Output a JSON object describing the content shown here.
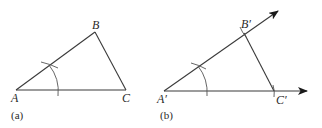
{
  "figure_a": {
    "caption": "(a)",
    "vertices": {
      "A": {
        "label": "A",
        "x": 16,
        "y": 90
      },
      "B": {
        "label": "B",
        "x": 95,
        "y": 32
      },
      "C": {
        "label": "C",
        "x": 126,
        "y": 90
      }
    }
  },
  "figure_b": {
    "caption": "(b)",
    "vertices": {
      "A": {
        "label": "A′",
        "x": 164,
        "y": 91
      },
      "B": {
        "label": "B′",
        "x": 244,
        "y": 33
      },
      "C": {
        "label": "C′",
        "x": 274,
        "y": 91
      }
    }
  },
  "colors": {
    "stroke": "#3a3a3a",
    "text": "#2a2a2a",
    "background": "#ffffff"
  }
}
